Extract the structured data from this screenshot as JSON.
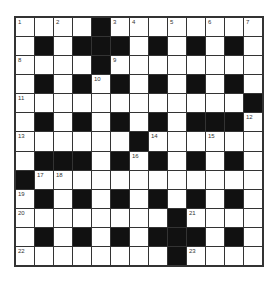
{
  "puzzle": {
    "rows": 13,
    "cols": 13,
    "grid": [
      "....#........",
      ".#.###.#.#.#.",
      "....#........",
      ".#.#.#.#.#.#.",
      "............#",
      ".#.#.#.#.###.",
      "......#......",
      ".###.#.#.#.#.",
      "#............",
      ".#.#.#.#.#.#.",
      "........#....",
      ".#.#.#.###.#.",
      "........#...."
    ],
    "numbers": [
      {
        "r": 0,
        "c": 0,
        "n": "1"
      },
      {
        "r": 0,
        "c": 2,
        "n": "2"
      },
      {
        "r": 0,
        "c": 5,
        "n": "3"
      },
      {
        "r": 0,
        "c": 6,
        "n": "4"
      },
      {
        "r": 0,
        "c": 8,
        "n": "5"
      },
      {
        "r": 0,
        "c": 10,
        "n": "6"
      },
      {
        "r": 0,
        "c": 12,
        "n": "7"
      },
      {
        "r": 2,
        "c": 0,
        "n": "8"
      },
      {
        "r": 2,
        "c": 5,
        "n": "9"
      },
      {
        "r": 3,
        "c": 4,
        "n": "10"
      },
      {
        "r": 4,
        "c": 0,
        "n": "11"
      },
      {
        "r": 5,
        "c": 12,
        "n": "12"
      },
      {
        "r": 6,
        "c": 0,
        "n": "13"
      },
      {
        "r": 6,
        "c": 7,
        "n": "14"
      },
      {
        "r": 6,
        "c": 10,
        "n": "15"
      },
      {
        "r": 7,
        "c": 6,
        "n": "16"
      },
      {
        "r": 8,
        "c": 1,
        "n": "17"
      },
      {
        "r": 8,
        "c": 2,
        "n": "18"
      },
      {
        "r": 9,
        "c": 0,
        "n": "19"
      },
      {
        "r": 10,
        "c": 0,
        "n": "20"
      },
      {
        "r": 10,
        "c": 9,
        "n": "21"
      },
      {
        "r": 12,
        "c": 0,
        "n": "22"
      },
      {
        "r": 12,
        "c": 9,
        "n": "23"
      }
    ]
  }
}
